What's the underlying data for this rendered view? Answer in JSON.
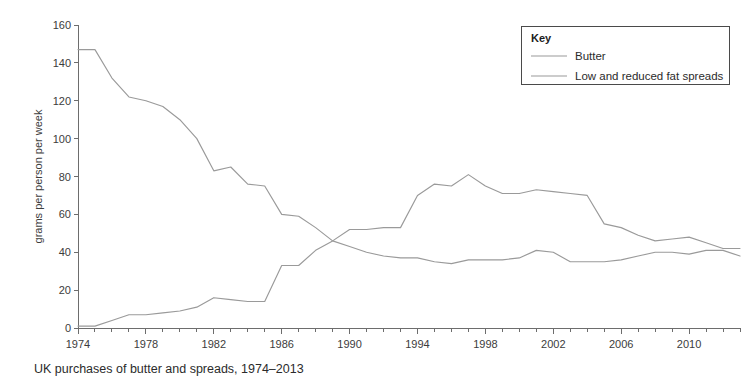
{
  "caption": "UK purchases of butter and spreads, 1974–2013",
  "legend": {
    "title": "Key",
    "entries": [
      {
        "label": "Butter",
        "color": "#9a9a9a"
      },
      {
        "label": "Low and reduced fat spreads",
        "color": "#9a9a9a"
      }
    ]
  },
  "chart_data": {
    "type": "line",
    "title": "UK purchases of butter and spreads, 1974–2013",
    "xlabel": "",
    "ylabel": "grams per person per week",
    "xlim": [
      1974,
      2013
    ],
    "ylim": [
      0,
      160
    ],
    "yticks": [
      0,
      20,
      40,
      60,
      80,
      100,
      120,
      140,
      160
    ],
    "xticks": [
      1974,
      1978,
      1982,
      1986,
      1990,
      1994,
      1998,
      2002,
      2006,
      2010
    ],
    "x_minor_tick_interval": 1,
    "grid": false,
    "legend_position": "top-right",
    "x": [
      1974,
      1975,
      1976,
      1977,
      1978,
      1979,
      1980,
      1981,
      1982,
      1983,
      1984,
      1985,
      1986,
      1987,
      1988,
      1989,
      1990,
      1991,
      1992,
      1993,
      1994,
      1995,
      1996,
      1997,
      1998,
      1999,
      2000,
      2001,
      2002,
      2003,
      2004,
      2005,
      2006,
      2007,
      2008,
      2009,
      2010,
      2011,
      2012,
      2013
    ],
    "series": [
      {
        "name": "Butter",
        "color": "#9a9a9a",
        "values": [
          147,
          147,
          132,
          122,
          120,
          117,
          110,
          100,
          83,
          85,
          76,
          75,
          60,
          59,
          53,
          46,
          43,
          40,
          38,
          37,
          37,
          35,
          34,
          36,
          36,
          36,
          37,
          41,
          40,
          35,
          35,
          35,
          36,
          38,
          40,
          40,
          39,
          41,
          41,
          38
        ]
      },
      {
        "name": "Low and reduced fat spreads",
        "color": "#9a9a9a",
        "values": [
          1,
          1,
          4,
          7,
          7,
          8,
          9,
          11,
          16,
          15,
          14,
          14,
          33,
          33,
          41,
          46,
          52,
          52,
          53,
          53,
          70,
          76,
          75,
          81,
          75,
          71,
          71,
          73,
          72,
          71,
          70,
          55,
          53,
          49,
          46,
          47,
          48,
          45,
          42,
          42
        ]
      }
    ]
  },
  "axis": {
    "y_axis_title": "grams per person per week"
  }
}
